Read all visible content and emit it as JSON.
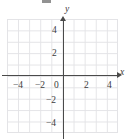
{
  "figure": {
    "kind": "cartesian-coordinate-grid",
    "title": "",
    "axis_labels": {
      "x": "x",
      "y": "y"
    },
    "axis_color": "#4a4a4a",
    "grid_color": "#e3e3e6",
    "label_color": "#3b3b3b",
    "background": "#ffffff",
    "xlim": [
      -5,
      5
    ],
    "ylim": [
      -5,
      5
    ],
    "tick_step": 2,
    "grid_step": 1,
    "x_ticks": [
      {
        "value": -4,
        "label": "−4",
        "left": 13,
        "top": 81
      },
      {
        "value": -2,
        "label": "−2",
        "left": 35,
        "top": 81
      },
      {
        "value": 0,
        "label": "0",
        "left": 54,
        "top": 81
      },
      {
        "value": 2,
        "label": "2",
        "left": 84,
        "top": 81
      },
      {
        "value": 4,
        "label": "4",
        "left": 107,
        "top": 81
      }
    ],
    "y_ticks": [
      {
        "value": 4,
        "label": "4",
        "left": 52,
        "top": 26
      },
      {
        "value": 2,
        "label": "2",
        "left": 52,
        "top": 49
      },
      {
        "value": -2,
        "label": "−2",
        "left": 46,
        "top": 96
      },
      {
        "value": -4,
        "label": "−4",
        "left": 46,
        "top": 119
      }
    ],
    "x_axis_name_pos": {
      "left": 120,
      "top": 68
    },
    "y_axis_name_pos": {
      "left": 65,
      "top": 5
    },
    "artifact_note": "scan-smudge"
  }
}
